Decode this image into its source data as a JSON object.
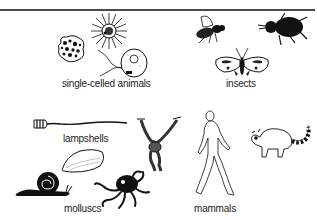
{
  "figure": {
    "groups": [
      {
        "id": "single-celled",
        "label": "single-celled animals",
        "animals": [
          "amoeba",
          "radiolarian",
          "flagellate"
        ]
      },
      {
        "id": "insects",
        "label": "insects",
        "animals": [
          "fly",
          "beetle",
          "moth"
        ]
      },
      {
        "id": "lampshells",
        "label": "lampshells",
        "animals": [
          "lampshell"
        ]
      },
      {
        "id": "molluscs",
        "label": "molluscs",
        "animals": [
          "snail",
          "mussel",
          "octopus"
        ]
      },
      {
        "id": "mammals",
        "label": "mammals",
        "animals": [
          "gibbon",
          "human",
          "lemur"
        ]
      }
    ],
    "colors": {
      "ink": "#111111",
      "rule": "#4a4a4a",
      "background": "#ffffff"
    }
  }
}
